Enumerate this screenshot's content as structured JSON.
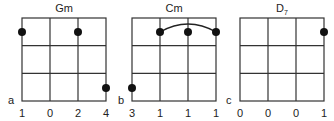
{
  "chords": [
    {
      "id": "a",
      "name": "Gm",
      "subscript": "",
      "letter": "a",
      "strings": [
        "1",
        "0",
        "2",
        "4"
      ],
      "dots": [
        {
          "string": 0,
          "fret": 1
        },
        {
          "string": 2,
          "fret": 1
        },
        {
          "string": 3,
          "fret": 4
        }
      ],
      "barre": null
    },
    {
      "id": "b",
      "name": "Cm",
      "subscript": "",
      "letter": "b",
      "strings": [
        "3",
        "1",
        "1",
        "1"
      ],
      "dots": [
        {
          "string": 1,
          "fret": 1
        },
        {
          "string": 2,
          "fret": 1
        },
        {
          "string": 3,
          "fret": 1
        },
        {
          "string": 0,
          "fret": 3
        }
      ],
      "barre": {
        "from": 1,
        "to": 3,
        "fret": 1
      }
    },
    {
      "id": "c",
      "name": "D",
      "subscript": "7",
      "letter": "c",
      "strings": [
        "0",
        "0",
        "0",
        "1"
      ],
      "dots": [
        {
          "string": 3,
          "fret": 1
        }
      ],
      "barre": null
    }
  ],
  "colors": {
    "line": "#333333",
    "dot": "#111111"
  }
}
